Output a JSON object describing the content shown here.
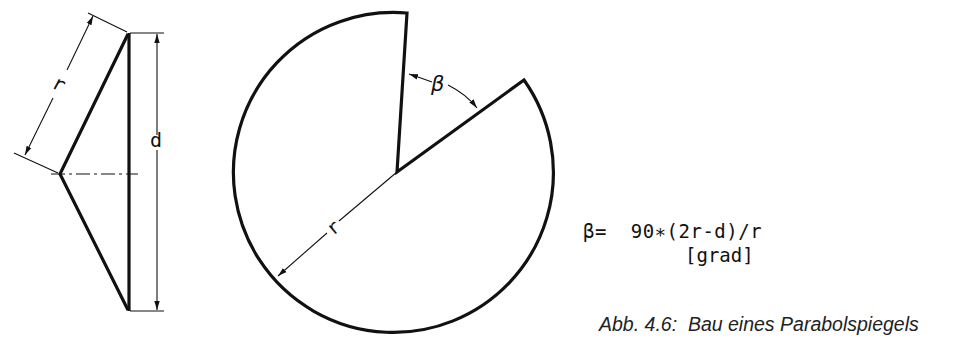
{
  "figure": {
    "caption": "Abb. 4.6:  Bau eines Parabolspiegels",
    "formula": "β=  90∗(2r-d)/r",
    "formula_unit": "[grad]"
  },
  "cone_side_view": {
    "label_slant": "r",
    "label_diameter": "d"
  },
  "flat_pattern": {
    "label_radius": "r",
    "label_angle": "β"
  },
  "colors": {
    "line": "#111111",
    "background": "#ffffff"
  }
}
